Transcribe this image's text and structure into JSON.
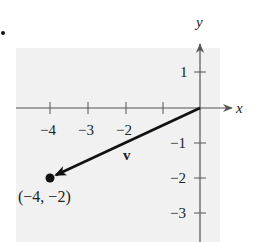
{
  "diagram": {
    "bullet": "•",
    "axes": {
      "x_label": "x",
      "y_label": "y",
      "x_ticks": [
        {
          "value": -4,
          "label": "−4"
        },
        {
          "value": -3,
          "label": "−3"
        },
        {
          "value": -2,
          "label": "−2"
        },
        {
          "value": -1,
          "label": ""
        }
      ],
      "y_ticks": [
        {
          "value": 1,
          "label": "1"
        },
        {
          "value": -1,
          "label": "−1"
        },
        {
          "value": -2,
          "label": "−2"
        },
        {
          "value": -3,
          "label": "−3"
        }
      ]
    },
    "vector": {
      "label": "v",
      "from": [
        0,
        0
      ],
      "to": [
        -4,
        -2
      ]
    },
    "point_label": "(−4, −2)",
    "colors": {
      "background": "#f1f1f1",
      "ink": "#111111"
    }
  }
}
